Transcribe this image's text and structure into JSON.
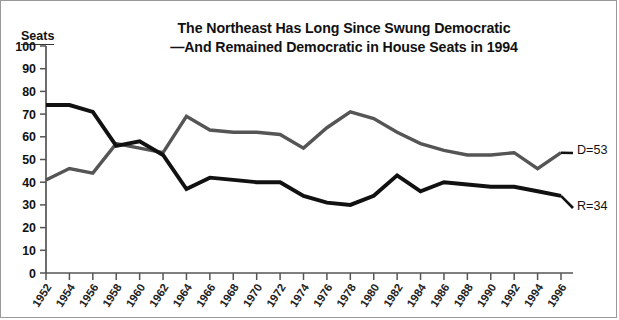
{
  "title": {
    "line1": "The Northeast Has Long Since Swung Democratic",
    "line2": "—And Remained Democratic in House Seats in 1994"
  },
  "axis": {
    "y_title": "Seats"
  },
  "annotations": {
    "democratic": "D=53",
    "republican": "R=34"
  },
  "colors": {
    "democratic_line": "#555555",
    "republican_line": "#111111",
    "axis": "#555555",
    "text": "#111111",
    "background": "#ffffff"
  },
  "chart_data": {
    "type": "line",
    "xlabel": "",
    "ylabel": "Seats",
    "ylim": [
      0,
      100
    ],
    "ytick_labels": [
      "0",
      "10",
      "20",
      "30",
      "40",
      "50",
      "60",
      "70",
      "80",
      "90",
      "100"
    ],
    "ytick_values": [
      0,
      10,
      20,
      30,
      40,
      50,
      60,
      70,
      80,
      90,
      100
    ],
    "grid": false,
    "legend": "inline-annotations-right",
    "x": [
      1952,
      1954,
      1956,
      1958,
      1960,
      1962,
      1964,
      1966,
      1968,
      1970,
      1972,
      1974,
      1976,
      1978,
      1980,
      1982,
      1984,
      1986,
      1988,
      1990,
      1992,
      1994,
      1996
    ],
    "categories": [
      "1952",
      "1954",
      "1956",
      "1958",
      "1960",
      "1962",
      "1964",
      "1966",
      "1968",
      "1970",
      "1972",
      "1974",
      "1976",
      "1978",
      "1980",
      "1982",
      "1984",
      "1986",
      "1988",
      "1990",
      "1992",
      "1994",
      "1996"
    ],
    "series": [
      {
        "name": "Democratic",
        "label": "D=53",
        "color": "#555555",
        "values": [
          41,
          46,
          44,
          57,
          55,
          53,
          69,
          63,
          62,
          62,
          61,
          55,
          64,
          71,
          68,
          62,
          57,
          54,
          52,
          52,
          53,
          46,
          53
        ]
      },
      {
        "name": "Republican",
        "label": "R=34",
        "color": "#111111",
        "values": [
          74,
          74,
          71,
          56,
          58,
          52,
          37,
          42,
          41,
          40,
          40,
          34,
          31,
          30,
          34,
          43,
          36,
          40,
          39,
          38,
          38,
          36,
          34
        ]
      }
    ]
  }
}
